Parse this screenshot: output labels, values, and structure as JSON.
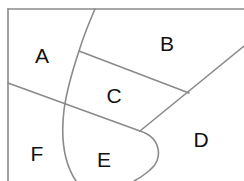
{
  "diagram": {
    "type": "region-map",
    "line_color": "#8a8a8a",
    "label_color": "#111111",
    "regions": [
      {
        "id": "A",
        "label": "A",
        "x": 42,
        "y": 55
      },
      {
        "id": "B",
        "label": "B",
        "x": 167,
        "y": 43
      },
      {
        "id": "C",
        "label": "C",
        "x": 114,
        "y": 95
      },
      {
        "id": "D",
        "label": "D",
        "x": 201,
        "y": 139
      },
      {
        "id": "E",
        "label": "E",
        "x": 104,
        "y": 159
      },
      {
        "id": "F",
        "label": "F",
        "x": 37,
        "y": 153
      }
    ]
  }
}
